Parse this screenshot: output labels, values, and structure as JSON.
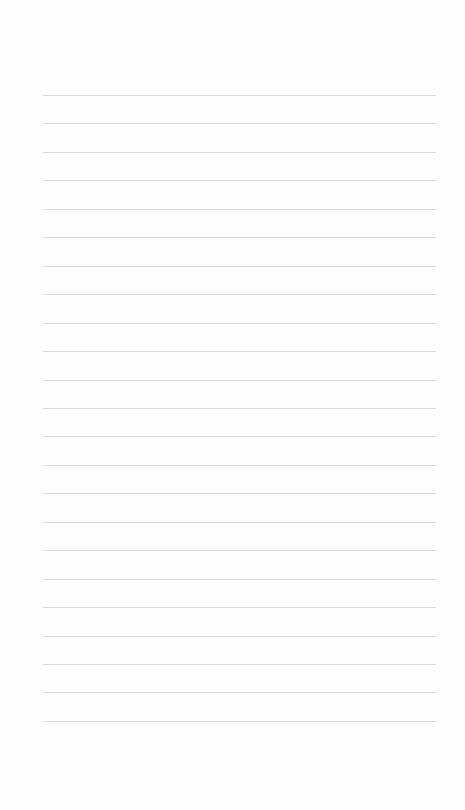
{
  "page": {
    "type": "blank lined paper",
    "background_color": "#fefefe",
    "line_color": "#d2d2d2",
    "line_count": 23,
    "first_line_y": 95,
    "line_spacing": 28.45,
    "line_left": 43,
    "line_width": 393
  }
}
